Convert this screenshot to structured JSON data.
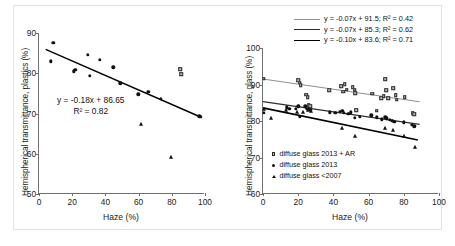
{
  "figure": {
    "background": "#ffffff",
    "border_color": "#e2e2e2"
  },
  "chart_data": [
    {
      "type": "scatter",
      "panel": "left",
      "title": "",
      "xlabel": "Haze (%)",
      "ylabel": "Hemispherical transmittance, plastics (%)",
      "xlim": [
        0,
        100
      ],
      "ylim": [
        50,
        90
      ],
      "xticks": [
        0,
        20,
        40,
        60,
        80,
        100
      ],
      "yticks": [
        50,
        60,
        70,
        80,
        90
      ],
      "grid": false,
      "annotations": [
        "y = -0.18x + 86.65",
        "R² = 0.82"
      ],
      "fit": {
        "slope": -0.18,
        "intercept": 86.65,
        "r2": 0.82,
        "x_start": 4,
        "x_end": 98,
        "color": "#000000"
      },
      "series": [
        {
          "name": "circles",
          "marker": "circle",
          "points": [
            [
              7.0,
              83.0
            ],
            [
              8.5,
              87.5
            ],
            [
              20.8,
              80.5
            ],
            [
              21.8,
              80.8
            ],
            [
              29.5,
              84.6
            ],
            [
              30.5,
              79.3
            ],
            [
              36.5,
              83.4
            ],
            [
              44.8,
              81.5
            ],
            [
              49.0,
              77.5
            ],
            [
              59.8,
              74.8
            ],
            [
              65.8,
              75.4
            ],
            [
              73.5,
              73.6
            ],
            [
              96.5,
              69.3
            ],
            [
              97.5,
              69.2
            ]
          ]
        },
        {
          "name": "triangles",
          "marker": "triangle",
          "points": [
            [
              61.5,
              67.3
            ],
            [
              79.8,
              59.3
            ]
          ]
        },
        {
          "name": "squares",
          "marker": "square",
          "points": [
            [
              85.0,
              81.0
            ],
            [
              85.8,
              79.7
            ]
          ]
        }
      ]
    },
    {
      "type": "scatter",
      "panel": "right",
      "title": "",
      "xlabel": "Haze (%)",
      "ylabel": "Hemispherical transmittance, glass (%)",
      "xlim": [
        0,
        100
      ],
      "ylim": [
        60,
        100
      ],
      "xticks": [
        0,
        20,
        40,
        60,
        80,
        100
      ],
      "yticks": [
        60,
        70,
        80,
        90,
        100
      ],
      "grid": false,
      "equation_legend": [
        {
          "label": "y = -0.07x + 91.5; R² = 0.42",
          "line": "light"
        },
        {
          "label": "y = -0.07x + 85.3; R² = 0.62",
          "line": "medium"
        },
        {
          "label": "y = -0.10x + 83.6; R² = 0.71",
          "line": "dark"
        }
      ],
      "key_legend": [
        {
          "label": "diffuse glass 2013 + AR",
          "marker": "square"
        },
        {
          "label": "diffuse glass 2013",
          "marker": "circle"
        },
        {
          "label": "diffuse glass <2007",
          "marker": "triangle"
        }
      ],
      "fits": [
        {
          "slope": -0.07,
          "intercept": 91.5,
          "r2": 0.42,
          "x_start": 0,
          "x_end": 89,
          "color": "#8f8f8f",
          "width": 1.0
        },
        {
          "slope": -0.07,
          "intercept": 85.3,
          "r2": 0.62,
          "x_start": 0,
          "x_end": 89,
          "color": "#2f2f2f",
          "width": 1.3
        },
        {
          "slope": -0.1,
          "intercept": 83.6,
          "r2": 0.71,
          "x_start": 0,
          "x_end": 88,
          "color": "#000000",
          "width": 1.6
        }
      ],
      "series": [
        {
          "name": "diffuse glass 2013 + AR",
          "marker": "square",
          "points": [
            [
              0.5,
              91.6
            ],
            [
              20.0,
              91.2
            ],
            [
              20.8,
              90.5
            ],
            [
              21.5,
              89.8
            ],
            [
              24.5,
              87.2
            ],
            [
              25.5,
              86.5
            ],
            [
              26.0,
              84.4
            ],
            [
              26.8,
              84.0
            ],
            [
              37.5,
              88.5
            ],
            [
              44.5,
              89.5
            ],
            [
              45.5,
              88.0
            ],
            [
              46.5,
              90.1
            ],
            [
              47.5,
              88.6
            ],
            [
              51.0,
              89.2
            ],
            [
              52.0,
              88.6
            ],
            [
              52.5,
              87.6
            ],
            [
              53.0,
              83.0
            ],
            [
              62.0,
              87.5
            ],
            [
              64.5,
              82.8
            ],
            [
              67.0,
              86.2
            ],
            [
              68.5,
              86.8
            ],
            [
              69.5,
              91.5
            ],
            [
              70.0,
              88.5
            ],
            [
              71.0,
              86.3
            ],
            [
              74.0,
              89.0
            ],
            [
              75.5,
              87.0
            ],
            [
              76.0,
              85.8
            ],
            [
              80.5,
              86.5
            ],
            [
              85.0,
              82.2
            ],
            [
              86.0,
              81.8
            ]
          ]
        },
        {
          "name": "diffuse glass 2013",
          "marker": "circle",
          "points": [
            [
              0.5,
              82.2
            ],
            [
              13.5,
              83.8
            ],
            [
              15.0,
              83.4
            ],
            [
              18.5,
              83.4
            ],
            [
              20.0,
              84.0
            ],
            [
              21.0,
              81.2
            ],
            [
              24.0,
              84.0
            ],
            [
              25.0,
              83.4
            ],
            [
              26.0,
              83.2
            ],
            [
              27.0,
              83.1
            ],
            [
              38.0,
              82.4
            ],
            [
              41.0,
              82.3
            ],
            [
              43.5,
              82.6
            ],
            [
              45.0,
              82.8
            ],
            [
              46.0,
              82.2
            ],
            [
              48.5,
              82.0
            ],
            [
              50.0,
              82.4
            ],
            [
              52.0,
              80.8
            ],
            [
              55.0,
              81.2
            ],
            [
              61.5,
              81.6
            ],
            [
              64.5,
              81.0
            ],
            [
              67.5,
              80.5
            ],
            [
              69.5,
              81.0
            ],
            [
              70.5,
              80.7
            ],
            [
              72.0,
              80.3
            ],
            [
              73.5,
              80.0
            ],
            [
              74.5,
              79.8
            ],
            [
              80.0,
              79.6
            ],
            [
              84.5,
              79.0
            ],
            [
              86.0,
              78.6
            ]
          ]
        },
        {
          "name": "diffuse glass <2007",
          "marker": "triangle",
          "points": [
            [
              0.5,
              83.4
            ],
            [
              4.5,
              80.8
            ],
            [
              13.0,
              83.0
            ],
            [
              19.5,
              82.6
            ],
            [
              22.5,
              82.4
            ],
            [
              25.5,
              83.0
            ],
            [
              27.5,
              82.8
            ],
            [
              45.0,
              78.2
            ],
            [
              52.0,
              75.8
            ],
            [
              69.5,
              78.0
            ],
            [
              74.0,
              77.6
            ],
            [
              80.0,
              75.8
            ],
            [
              86.5,
              73.0
            ]
          ]
        }
      ]
    }
  ]
}
